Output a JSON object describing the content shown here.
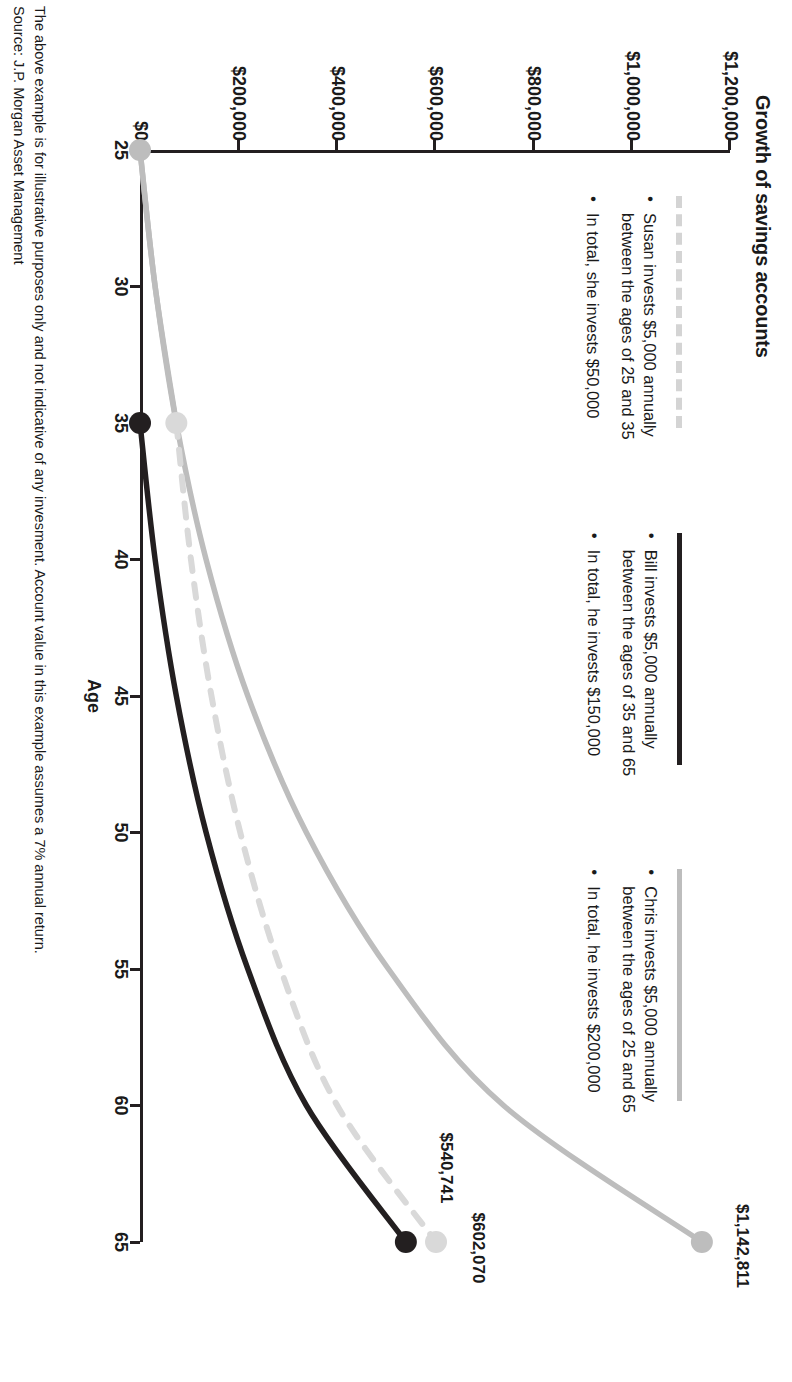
{
  "title": "Growth of savings accounts",
  "axes": {
    "x_title": "Age",
    "x_ticks": [
      "25",
      "30",
      "35",
      "40",
      "45",
      "50",
      "55",
      "60",
      "65"
    ],
    "y_ticks": [
      "$0",
      "$200,000",
      "$400,000",
      "$600,000",
      "$800,000",
      "$1,000,000",
      "$1,200,000"
    ]
  },
  "legend": {
    "susan": {
      "swatch": "light-gray-dashed-line",
      "bullets": [
        "Susan invests $5,000 annually between the ages of 25 and 35",
        "In total, she invests $50,000"
      ]
    },
    "bill": {
      "swatch": "black-solid-line",
      "bullets": [
        "Bill invests $5,000 annually between the ages of 35 and 65",
        "In total, he invests $150,000"
      ]
    },
    "chris": {
      "swatch": "gray-solid-line",
      "bullets": [
        "Chris invests $5,000 annually between the ages of 25 and 65",
        "In total, he invests $200,000"
      ]
    }
  },
  "endpoint_labels": {
    "bill": "$540,741",
    "susan": "$602,070",
    "chris": "$1,142,811"
  },
  "footnotes": [
    "The above example is for illustrative purposes only and not indicative of any invesment. Account value in this example assumes a 7% annual return.",
    "Source: J.P. Morgan Asset Management"
  ],
  "colors": {
    "bill": "#231f20",
    "susan": "#d9d9d9",
    "chris": "#bdbdbd",
    "axis": "#231f20"
  },
  "chart_data": {
    "type": "line",
    "title": "Growth of savings accounts",
    "xlabel": "Age",
    "ylabel": "",
    "xlim": [
      25,
      65
    ],
    "ylim": [
      0,
      1200000
    ],
    "grid": false,
    "legend_position": "top-right",
    "annotations": [
      "$540,741",
      "$602,070",
      "$1,142,811"
    ],
    "x": [
      25,
      30,
      35,
      40,
      45,
      50,
      55,
      60,
      65
    ],
    "series": [
      {
        "name": "Susan",
        "style": "dashed",
        "color": "#d9d9d9",
        "description": "Invests $5,000/yr from age 25 to 35, then stops; balance keeps compounding at 7%",
        "values": [
          0,
          30766,
          73918,
          103672,
          145400,
          203927,
          286028,
          401173,
          602070
        ]
      },
      {
        "name": "Bill",
        "style": "solid",
        "color": "#231f20",
        "description": "Invests $5,000/yr from age 35 to 65 at 7%",
        "values": [
          0,
          0,
          0,
          30766,
          73918,
          134440,
          219326,
          338382,
          540741
        ]
      },
      {
        "name": "Chris",
        "style": "solid",
        "color": "#bdbdbd",
        "description": "Invests $5,000/yr from age 25 to 65 at 7%",
        "values": [
          0,
          30766,
          73918,
          134440,
          219326,
          338382,
          505365,
          739567,
          1142811
        ]
      }
    ],
    "endpoints": [
      {
        "series": "Bill",
        "x": 65,
        "y": 540741,
        "label": "$540,741"
      },
      {
        "series": "Susan",
        "x": 65,
        "y": 602070,
        "label": "$602,070"
      },
      {
        "series": "Chris",
        "x": 65,
        "y": 1142811,
        "label": "$1,142,811"
      }
    ],
    "markers": [
      {
        "series": "Chris",
        "x": 25,
        "y": 0
      },
      {
        "series": "Bill",
        "x": 35,
        "y": 0
      },
      {
        "series": "Susan",
        "x": 35,
        "y": 73918
      }
    ]
  }
}
